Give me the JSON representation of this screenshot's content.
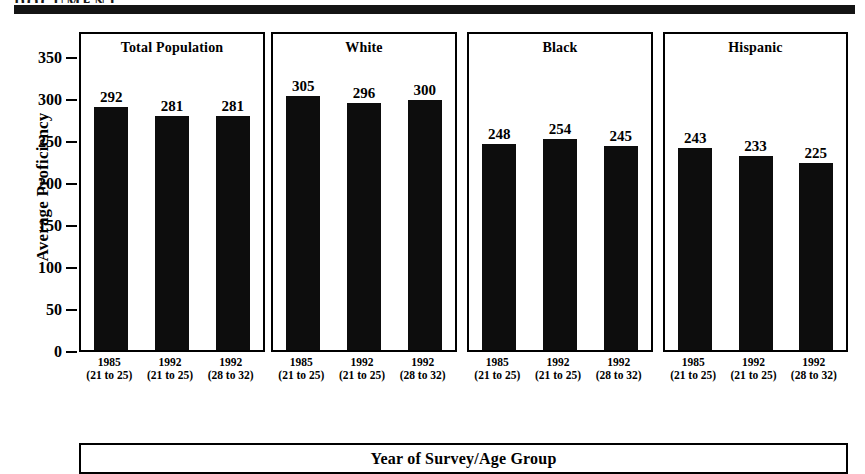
{
  "page": {
    "header_text": "DOCUMENT"
  },
  "chart_data": {
    "type": "bar",
    "title": "",
    "xlabel": "Year of Survey/Age Group",
    "ylabel": "Average Proficiency",
    "ylim": [
      0,
      350
    ],
    "yticks": [
      350,
      300,
      250,
      200,
      150,
      100,
      50,
      0
    ],
    "ytick_labels": [
      "350",
      "300",
      "250",
      "200",
      "150",
      "100",
      "50",
      "0"
    ],
    "grid": false,
    "legend": "none",
    "categories": [
      "1985 (21 to 25)",
      "1992 (21 to 25)",
      "1992 (28 to 32)"
    ],
    "category_years": [
      "1985",
      "1992",
      "1992"
    ],
    "category_ages": [
      "(21 to 25)",
      "(21 to 25)",
      "(28 to 32)"
    ],
    "panels": [
      {
        "name": "Total Population",
        "values": [
          292,
          281,
          281
        ],
        "labels": [
          "292",
          "281",
          "281"
        ]
      },
      {
        "name": "White",
        "values": [
          305,
          296,
          300
        ],
        "labels": [
          "305",
          "296",
          "300"
        ]
      },
      {
        "name": "Black",
        "values": [
          248,
          254,
          245
        ],
        "labels": [
          "248",
          "254",
          "245"
        ]
      },
      {
        "name": "Hispanic",
        "values": [
          243,
          233,
          225
        ],
        "labels": [
          "243",
          "233",
          "225"
        ]
      }
    ],
    "bar_color": "#0d0d0d"
  }
}
